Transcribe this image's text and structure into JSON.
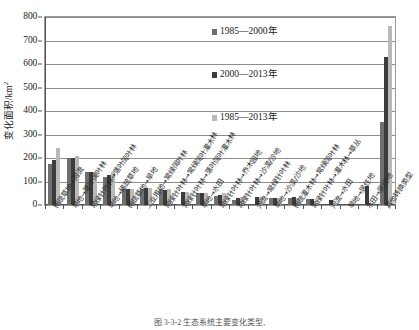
{
  "chart_data": {
    "type": "bar",
    "title": "",
    "xlabel": "",
    "ylabel": "变化面积/km²",
    "ylim": [
      0,
      800
    ],
    "yticks": [
      0,
      100,
      200,
      300,
      400,
      500,
      600,
      700,
      800
    ],
    "grid": true,
    "legend_position": "upper-center",
    "categories": [
      "稀疏草地→河流",
      "旱地→落叶阔叶林",
      "常绿针叶林→落叶阔叶林",
      "旱地→稀疏草地",
      "稀疏草地→旱地",
      "工业用地→常绿阔叶林",
      "常绿针叶林→常绿阔叶灌木林",
      "常绿针叶林→落叶阔叶灌木林",
      "旱地→水田",
      "常绿针叶林→乔木园地",
      "常绿针叶林→沙漠/沙地",
      "河流→常绿针叶林",
      "旱地→沙漠/沙地",
      "稀疏灌木林→常绿阔叶林",
      "常绿针叶林→灌木林→草丛",
      "河流→水田",
      "旱地→居住地",
      "水田→居住地",
      "其他转换类型"
    ],
    "series": [
      {
        "name": "1985—2000年",
        "color": "#6f6f6f",
        "values": [
          175,
          199,
          142,
          119,
          67,
          70,
          67,
          6,
          53,
          38,
          21,
          0,
          28,
          31,
          25,
          0,
          0,
          0,
          355
        ]
      },
      {
        "name": "2000—2013年",
        "color": "#3c3c3c",
        "values": [
          190,
          202,
          141,
          126,
          68,
          71,
          66,
          56,
          52,
          41,
          31,
          34,
          29,
          32,
          24,
          22,
          0,
          79,
          630
        ]
      },
      {
        "name": "1985—2013年",
        "color": "#b9b9b9",
        "values": [
          242,
          207,
          142,
          140,
          68,
          71,
          67,
          57,
          53,
          51,
          32,
          35,
          29,
          31,
          10,
          3,
          0,
          0,
          760
        ]
      }
    ]
  },
  "legend": {
    "items": [
      {
        "label": "1985—2000年",
        "swatch": "#6f6f6f"
      },
      {
        "label": "2000—2013年",
        "swatch": "#3c3c3c"
      },
      {
        "label": "1985—2013年",
        "swatch": "#b9b9b9"
      }
    ]
  },
  "axis": {
    "y_title_main": "变化面积/km",
    "y_title_sup": "2"
  },
  "caption": {
    "text": "图 3-3-2  生态系统主要变化类型,"
  }
}
